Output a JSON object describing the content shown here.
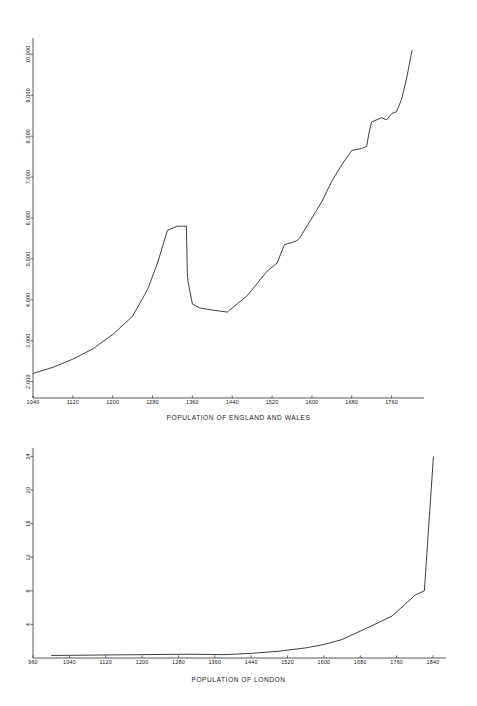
{
  "document": {
    "background_color": "#ffffff",
    "ink_color": "#1b1b1b"
  },
  "charts": [
    {
      "id": "england-and-wales",
      "axis_title": "POPULATION OF ENGLAND AND WALES"
    },
    {
      "id": "london",
      "axis_title": "POPULATION OF LONDON"
    }
  ],
  "chart_data": [
    {
      "type": "line",
      "title": "POPULATION OF ENGLAND AND WALES",
      "xlabel": "POPULATION OF ENGLAND AND WALES",
      "ylabel": "",
      "xlim": [
        1040,
        1801
      ],
      "ylim": [
        1600,
        10400
      ],
      "xticks": [
        1040,
        1120,
        1200,
        1280,
        1360,
        1440,
        1520,
        1600,
        1680,
        1760
      ],
      "xtick_labels": [
        "1040",
        "1120",
        "1200",
        "1280",
        "1360",
        "1440",
        "1520",
        "1600",
        "1680",
        "1760"
      ],
      "yticks": [
        2000,
        3000,
        4000,
        5000,
        6000,
        7000,
        8000,
        9000,
        10000
      ],
      "ytick_labels": [
        "2,000",
        "3,000",
        "4,000",
        "5,000",
        "6,000",
        "7,000",
        "8,000",
        "9,000",
        "10,000"
      ],
      "ytick_rotation_degrees": 90,
      "grid": false,
      "legend": false,
      "series": [
        {
          "name": "England and Wales population (thousands)",
          "x": [
            1040,
            1080,
            1120,
            1160,
            1200,
            1240,
            1270,
            1290,
            1310,
            1330,
            1340,
            1348,
            1350,
            1352,
            1360,
            1375,
            1400,
            1430,
            1450,
            1470,
            1490,
            1510,
            1530,
            1545,
            1560,
            1570,
            1575,
            1600,
            1620,
            1640,
            1660,
            1680,
            1700,
            1710,
            1715,
            1720,
            1740,
            1750,
            1760,
            1770,
            1780,
            1790,
            1801
          ],
          "y": [
            2200,
            2350,
            2550,
            2800,
            3150,
            3600,
            4250,
            4900,
            5700,
            5800,
            5800,
            5800,
            4600,
            4400,
            3900,
            3800,
            3750,
            3700,
            3900,
            4100,
            4400,
            4700,
            4900,
            5350,
            5400,
            5450,
            5500,
            6000,
            6400,
            6900,
            7300,
            7650,
            7700,
            7750,
            8100,
            8350,
            8450,
            8400,
            8550,
            8600,
            8900,
            9400,
            10100
          ]
        }
      ]
    },
    {
      "type": "line",
      "title": "POPULATION OF LONDON",
      "xlabel": "POPULATION OF LONDON",
      "ylabel": "",
      "xlim": [
        960,
        1851
      ],
      "ylim": [
        0,
        25
      ],
      "xticks": [
        960,
        1040,
        1120,
        1200,
        1280,
        1360,
        1440,
        1520,
        1600,
        1680,
        1760,
        1840
      ],
      "xtick_labels": [
        "960",
        "1040",
        "1120",
        "1200",
        "1280",
        "1360",
        "1440",
        "1520",
        "1600",
        "1680",
        "1760",
        "1840"
      ],
      "yticks": [
        4,
        8,
        12,
        16,
        20,
        24
      ],
      "ytick_labels": [
        "4",
        "8",
        "12",
        "16",
        "20",
        "24"
      ],
      "ytick_rotation_degrees": 90,
      "grid": false,
      "legend": false,
      "series": [
        {
          "name": "London population (ten-thousands)",
          "x": [
            1000,
            1100,
            1200,
            1300,
            1380,
            1440,
            1500,
            1560,
            1600,
            1640,
            1680,
            1700,
            1750,
            1801,
            1821,
            1841
          ],
          "y": [
            0.3,
            0.35,
            0.4,
            0.45,
            0.4,
            0.55,
            0.8,
            1.2,
            1.6,
            2.2,
            3.2,
            3.7,
            5.0,
            7.5,
            8.0,
            24.0
          ]
        }
      ]
    }
  ]
}
